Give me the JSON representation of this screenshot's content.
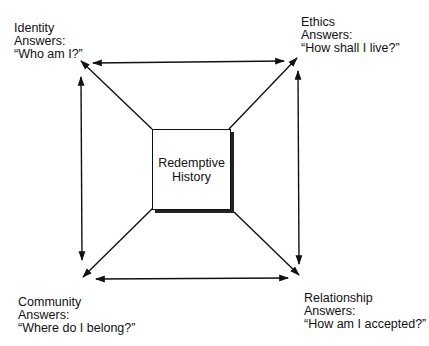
{
  "diagram": {
    "center": {
      "line1": "Redemptive",
      "line2": "History"
    },
    "corners": {
      "top_left": {
        "title": "Identity",
        "subtitle": "Answers:",
        "question": "“Who am I?”"
      },
      "top_right": {
        "title": "Ethics",
        "subtitle": "Answers:",
        "question": "“How shall I live?”"
      },
      "bottom_left": {
        "title": "Community",
        "subtitle": "Answers:",
        "question": "“Where do I belong?”"
      },
      "bottom_right": {
        "title": "Relationship",
        "subtitle": "Answers:",
        "question": "“How am I accepted?”"
      }
    },
    "connections": [
      {
        "from": "top_left",
        "to": "top_right",
        "type": "double-arrow"
      },
      {
        "from": "top_left",
        "to": "bottom_left",
        "type": "double-arrow"
      },
      {
        "from": "top_right",
        "to": "bottom_right",
        "type": "double-arrow"
      },
      {
        "from": "bottom_left",
        "to": "bottom_right",
        "type": "double-arrow"
      },
      {
        "from": "center",
        "to": "top_left",
        "type": "arrow"
      },
      {
        "from": "center",
        "to": "top_right",
        "type": "arrow"
      },
      {
        "from": "center",
        "to": "bottom_left",
        "type": "arrow"
      },
      {
        "from": "center",
        "to": "bottom_right",
        "type": "arrow"
      }
    ],
    "colors": {
      "line": "#111111",
      "background": "#ffffff"
    }
  }
}
